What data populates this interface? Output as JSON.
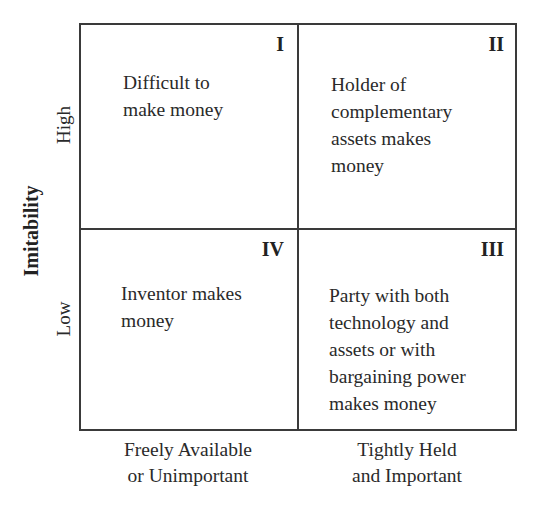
{
  "diagram": {
    "type": "2x2 matrix",
    "y_axis": {
      "title": "Imitability",
      "levels": {
        "high": "High",
        "low": "Low"
      }
    },
    "x_axis": {
      "levels": {
        "left": "Freely Available\nor Unimportant",
        "right": "Tightly Held\nand Important"
      }
    },
    "quadrants": {
      "q1": {
        "numeral": "I",
        "text": "Difficult to\nmake money"
      },
      "q2": {
        "numeral": "II",
        "text": "Holder of\ncomplementary\nassets makes\nmoney"
      },
      "q3": {
        "numeral": "III",
        "text": "Party with both\ntechnology and\nassets or with\nbargaining power\nmakes money"
      },
      "q4": {
        "numeral": "IV",
        "text": "Inventor makes\nmoney"
      }
    },
    "colors": {
      "line": "#3a3a3a",
      "text": "#222222",
      "background": "#ffffff"
    }
  }
}
